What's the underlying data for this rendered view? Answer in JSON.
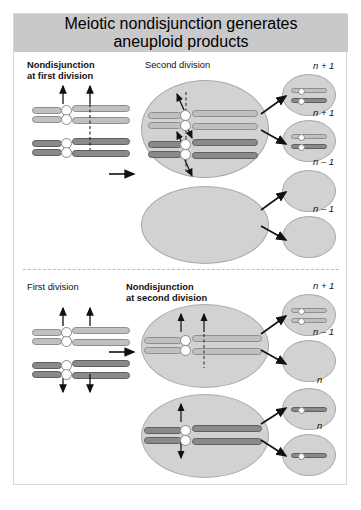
{
  "title": {
    "line1": "Meiotic nondisjunction generates",
    "line2": "aneuploid products"
  },
  "panels": [
    {
      "id": "nondisjunction-first-division",
      "left_header": "Nondisjunction\nat first division",
      "left_header_bold": true,
      "right_header": "Second division",
      "right_header_bold": false,
      "products": [
        {
          "label": "n + 1",
          "chromosomes": 2,
          "shade": "mixed"
        },
        {
          "label": "n + 1",
          "chromosomes": 2,
          "shade": "mixed"
        },
        {
          "label": "n – 1",
          "chromosomes": 0,
          "shade": "none"
        },
        {
          "label": "n – 1",
          "chromosomes": 0,
          "shade": "none"
        }
      ],
      "second_division_cells": [
        {
          "contents": "two light and two dark dyads, nondisjoined"
        },
        {
          "contents": "empty"
        }
      ]
    },
    {
      "id": "nondisjunction-second-division",
      "left_header": "First division",
      "left_header_bold": false,
      "right_header": "Nondisjunction\nat second division",
      "right_header_bold": true,
      "products": [
        {
          "label": "n + 1",
          "chromosomes": 2,
          "shade": "light"
        },
        {
          "label": "n – 1",
          "chromosomes": 0,
          "shade": "none"
        },
        {
          "label": "n",
          "chromosomes": 1,
          "shade": "dark"
        },
        {
          "label": "n",
          "chromosomes": 1,
          "shade": "dark"
        }
      ],
      "second_division_cells": [
        {
          "contents": "two light chromatids moving to same pole"
        },
        {
          "contents": "two dark chromatids separating normally"
        }
      ]
    }
  ],
  "colors": {
    "title_bar": "#c9c9c9",
    "cell_fill": "#d2d2d2",
    "cell_stroke": "#a9a9a9",
    "chromosome_light": "#c0c0c0",
    "chromosome_dark": "#8a8a8a",
    "centromere": "#ffffff",
    "frame": "#d8d8d8",
    "divider": "#bdbdbd"
  }
}
